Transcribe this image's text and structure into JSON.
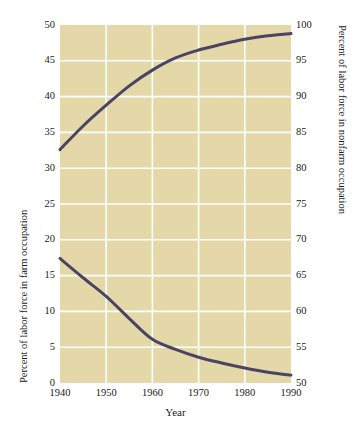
{
  "chart_data": {
    "type": "line",
    "title": "",
    "xlabel": "Year",
    "ylabel": "Percent of labor force in farm occupation",
    "ylabel_right": "Percent of labor force in nonfarm occupation",
    "x": [
      1940,
      1945,
      1950,
      1955,
      1960,
      1965,
      1970,
      1975,
      1980,
      1985,
      1990
    ],
    "xlim": [
      1940,
      1990
    ],
    "ylim": [
      0,
      50
    ],
    "ylim_right": [
      50,
      100
    ],
    "xticks": [
      1940,
      1950,
      1960,
      1970,
      1980,
      1990
    ],
    "yticks": [
      0,
      5,
      10,
      15,
      20,
      25,
      30,
      35,
      40,
      45,
      50
    ],
    "yticks_right": [
      50,
      55,
      60,
      65,
      70,
      75,
      80,
      85,
      90,
      95,
      100
    ],
    "grid": true,
    "legend": "none",
    "series": [
      {
        "name": "Percent of labor force in nonfarm occupation",
        "axis": "right",
        "color": "#4a4464",
        "values": [
          32.6,
          35.9,
          38.8,
          41.5,
          43.7,
          45.4,
          46.5,
          47.3,
          48.0,
          48.5,
          48.8
        ]
      },
      {
        "name": "Percent of labor force in farm occupation",
        "axis": "left",
        "color": "#4a4464",
        "values": [
          17.4,
          14.7,
          12.1,
          9.0,
          6.1,
          4.7,
          3.6,
          2.8,
          2.1,
          1.5,
          1.1
        ]
      }
    ]
  },
  "style": {
    "plot_background": "#e5d8a8",
    "grid_color": "#ffffff",
    "line_color": "#4a4464",
    "page_background": "#ffffff",
    "text_color": "#1a1a1a"
  }
}
